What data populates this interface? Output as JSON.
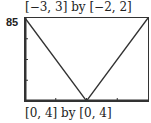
{
  "figure": {
    "number": "85",
    "top_caption": "[−3, 3] by [−2, 2]",
    "bottom_caption": "[0, 4] by [0, 4]"
  },
  "chart_data": {
    "type": "line",
    "title": "",
    "xlabel": "",
    "ylabel": "",
    "xlim": [
      0,
      4
    ],
    "ylim": [
      0,
      4
    ],
    "x_ticks": [
      1,
      2,
      3
    ],
    "y_ticks": [
      1,
      2,
      3
    ],
    "grid": false,
    "series": [
      {
        "name": "y = 2|x - 2|",
        "x": [
          0,
          2,
          4
        ],
        "y": [
          4,
          0,
          4
        ]
      }
    ],
    "window_labels": [
      "[−3, 3] by [−2, 2]",
      "[0, 4] by [0, 4]"
    ],
    "colors": {
      "line": "#333333",
      "frame": "#333333",
      "background": "#ffffff"
    }
  }
}
